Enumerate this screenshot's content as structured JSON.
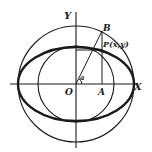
{
  "diagram": {
    "colors": {
      "ink": "#1a1a1a",
      "background": "#ffffff"
    },
    "labels": {
      "y_axis": "Y",
      "x_axis": "X",
      "origin": "O",
      "point_a": "A",
      "point_b": "B",
      "point_p": "P(x,y)",
      "angle": "a"
    },
    "geometry": {
      "center": [
        76,
        84
      ],
      "outer_circle_radius": 58,
      "inner_circle_radius": 38,
      "ellipse_semi_major": 58,
      "ellipse_semi_minor": 38,
      "point_B": [
        102,
        31
      ],
      "point_A": [
        102,
        84
      ],
      "point_P": [
        102,
        49
      ]
    }
  }
}
